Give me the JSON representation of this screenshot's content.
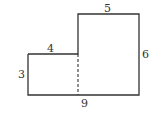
{
  "diagram": {
    "type": "composite rectangle (L-shape)",
    "labels": {
      "top": "5",
      "step_top": "4",
      "right": "6",
      "left": "3",
      "bottom": "9"
    },
    "colors": {
      "stroke": "#333333",
      "background": "#ffffff"
    }
  }
}
